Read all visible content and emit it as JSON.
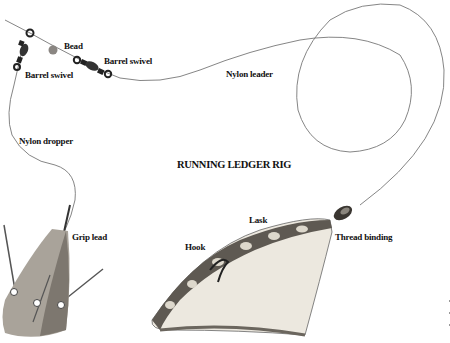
{
  "diagram": {
    "title": "RUNNING LEDGER RIG",
    "labels": {
      "bead": "Bead",
      "barrel_swivel_right": "Barrel swivel",
      "barrel_swivel_left": "Barrel swivel",
      "nylon_leader": "Nylon leader",
      "nylon_dropper": "Nylon dropper",
      "grip_lead": "Grip lead",
      "lask": "Lask",
      "hook": "Hook",
      "thread_binding": "Thread binding"
    },
    "colors": {
      "line": "#777777",
      "text": "#111111",
      "lead": "#a9a39a",
      "lead_shadow": "#7d776f",
      "bait_skin": "#ece8df",
      "bait_stripe": "#3a3631",
      "swivel": "#222222",
      "bead": "#8a8682"
    }
  }
}
